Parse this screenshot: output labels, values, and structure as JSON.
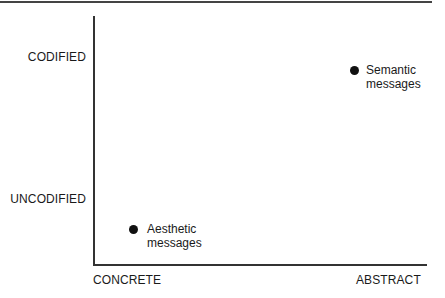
{
  "diagram": {
    "y_axis": {
      "labels": [
        "CODIFIED",
        "UNCODIFIED"
      ]
    },
    "x_axis": {
      "labels": [
        "CONCRETE",
        "ABSTRACT"
      ]
    },
    "points": [
      {
        "label_line1": "Semantic",
        "label_line2": "messages",
        "x": "abstract",
        "y": "codified"
      },
      {
        "label_line1": "Aesthetic",
        "label_line2": "messages",
        "x": "concrete",
        "y": "uncodified"
      }
    ]
  }
}
